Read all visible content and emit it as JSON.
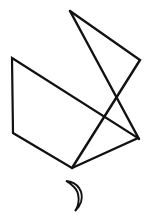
{
  "canvas": {
    "width": 151,
    "height": 222,
    "background_color": "#ffffff",
    "stroke_color": "#111111"
  },
  "drawing": {
    "title": "Geometric line figure with crescent",
    "shapes": [
      {
        "name": "quadrilateral",
        "kind": "polygon",
        "closed": true,
        "stroke_width": 2.2,
        "points": "12,58 138,138 72,168 13,133"
      },
      {
        "name": "zigzag-triangle",
        "kind": "polyline",
        "closed": false,
        "stroke_width": 2.4,
        "points": "70,11 140,60 72,168"
      },
      {
        "name": "apex-spike",
        "kind": "polyline",
        "closed": false,
        "stroke_width": 2.4,
        "points": "70,11 139,139"
      },
      {
        "name": "crescent",
        "kind": "path",
        "closed": false,
        "stroke_width": 1.9,
        "path": "M 66,181 C 78,182 84,192 81,202 C 79,208 76,210 75,211 C 80,204 80,193 74,187 C 71,184 68,182 66,181 Z"
      }
    ]
  }
}
